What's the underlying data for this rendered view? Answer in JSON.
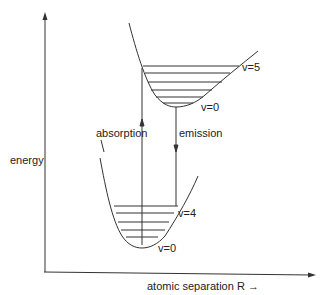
{
  "diagram": {
    "axes": {
      "y_label": "energy",
      "x_label": "atomic separation R →"
    },
    "upper_curve": {
      "levels_top_label": "v=5",
      "levels_bottom_label": "v=0",
      "level_count": 6
    },
    "lower_curve": {
      "levels_top_label": "v=4",
      "levels_bottom_label": "v=0",
      "level_count": 5
    },
    "transitions": {
      "absorption_label": "absorption",
      "emission_label": "emission"
    },
    "colors": {
      "line": "#333333",
      "background": "#ffffff"
    }
  }
}
